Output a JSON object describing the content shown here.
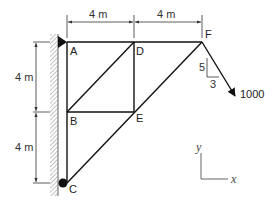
{
  "diagram": {
    "type": "truss",
    "nodes": [
      {
        "id": "A",
        "label": "A",
        "x": 67,
        "y": 42
      },
      {
        "id": "D",
        "label": "D",
        "x": 134,
        "y": 42
      },
      {
        "id": "F",
        "label": "F",
        "x": 202,
        "y": 42
      },
      {
        "id": "B",
        "label": "B",
        "x": 67,
        "y": 112
      },
      {
        "id": "E",
        "label": "E",
        "x": 134,
        "y": 112
      },
      {
        "id": "C",
        "label": "C",
        "x": 67,
        "y": 183
      }
    ],
    "members": [
      "AD",
      "DF",
      "AB",
      "BC",
      "DE",
      "BE",
      "BD",
      "CE",
      "EF"
    ],
    "dimensions": {
      "top_left": "4 m",
      "top_right": "4 m",
      "left_upper": "4 m",
      "left_lower": "4 m"
    },
    "load": {
      "magnitude": "1000",
      "slope_vertical": "5",
      "slope_horizontal": "3"
    },
    "axes": {
      "x_label": "x",
      "y_label": "y"
    },
    "supports": {
      "A": "pin",
      "C": "roller"
    }
  }
}
